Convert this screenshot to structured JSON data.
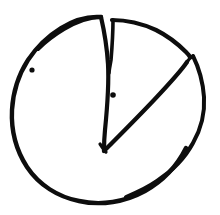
{
  "figure": {
    "kind": "pie",
    "background_color": "#ffffff",
    "ink_color": "#0d0d0d",
    "canvas": {
      "width": 220,
      "height": 215
    }
  },
  "chart_data": {
    "type": "pie",
    "xlabel": "",
    "ylabel": "",
    "grid": false,
    "legend": "none",
    "center": {
      "x": 104,
      "y": 150
    },
    "radius": 97,
    "categories": [
      "Large slice",
      "Thin wedge",
      "Exploded slice"
    ],
    "values": [
      62,
      3,
      35
    ],
    "slices": [
      {
        "name": "Large slice",
        "value": 62,
        "start_angle_deg": 97,
        "end_angle_deg": 320,
        "exploded": false,
        "fill": "none",
        "marker_dot": {
          "x": 32,
          "y": 70
        }
      },
      {
        "name": "Thin wedge",
        "value": 3,
        "start_angle_deg": 90,
        "end_angle_deg": 97,
        "exploded": false,
        "fill": "none",
        "marker_dot": null
      },
      {
        "name": "Exploded slice",
        "value": 35,
        "start_angle_deg": 30,
        "end_angle_deg": 90,
        "exploded": true,
        "fill": "none",
        "marker_dot": {
          "x": 113,
          "y": 95
        }
      }
    ],
    "annotations": [
      {
        "name": "dot-left",
        "x": 32,
        "y": 70,
        "radius": 2.6
      },
      {
        "name": "dot-center",
        "x": 113,
        "y": 95,
        "radius": 2.8
      }
    ]
  },
  "geometry": {
    "outer_arc_main": "M 104 150 L 100 18 C 78 17 55 28 38 47 C 22 65 13 92 13 118 C 13 146 25 172 45 188 C 66 205 97 208 124 198 C 152 188 173 166 182 141",
    "outer_arc_main_note": "main circle sweep from top notch counter-clockwise round to lower right",
    "circle_path": "M 100 18 C 78 17 55 28 38 47 C 22 65 12 92 13 119 C 14 147 26 173 46 189 C 67 206 98 208 125 197 C 152 187 173 165 182 141",
    "wedge_notch_left": "M 100 18 L 108 72 L 104 150",
    "wedge_notch_right": "M 113 20 L 111 70",
    "slice_top_edge": "M 113 20 C 136 22 158 31 175 44 C 181 49 185 52 189 56",
    "slice_radial_edge": "M 104 150 L 189 56",
    "slice_outer_arc": "M 192 58 C 200 72 205 90 204 106 C 203 124 196 141 184 155 C 170 171 150 185 128 194",
    "slice_tip_join": "M 189 56 L 193 57",
    "lower_radial": "M 104 150 L 186 68"
  },
  "strokes": {
    "main_width": 4.2,
    "secondary_width": 3.4,
    "thin_width": 2.6
  }
}
